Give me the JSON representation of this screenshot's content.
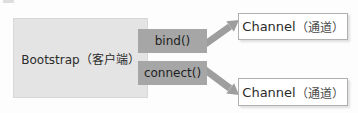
{
  "diagram": {
    "nodes": {
      "bootstrap": {
        "label": "Bootstrap（客户端）"
      },
      "bind": {
        "label": "bind()"
      },
      "connect": {
        "label": "connect()"
      },
      "channel_top": {
        "label_en": "Channel",
        "label_zh": "（通道）"
      },
      "channel_bottom": {
        "label_en": "Channel",
        "label_zh": "（通道）"
      }
    },
    "arrows": [
      {
        "name": "bind-to-channel-top",
        "from": "bind",
        "to": "channel_top"
      },
      {
        "name": "connect-to-channel-bottom",
        "from": "connect",
        "to": "channel_bottom"
      }
    ],
    "colors": {
      "bootstrap_fill": "#e4e4e4",
      "method_fill": "#a6a6a6",
      "arrow": "#9e9e9e",
      "channel_fill": "#ffffff",
      "channel_border": "#b0b0b0",
      "text": "#2b2b2b"
    }
  }
}
